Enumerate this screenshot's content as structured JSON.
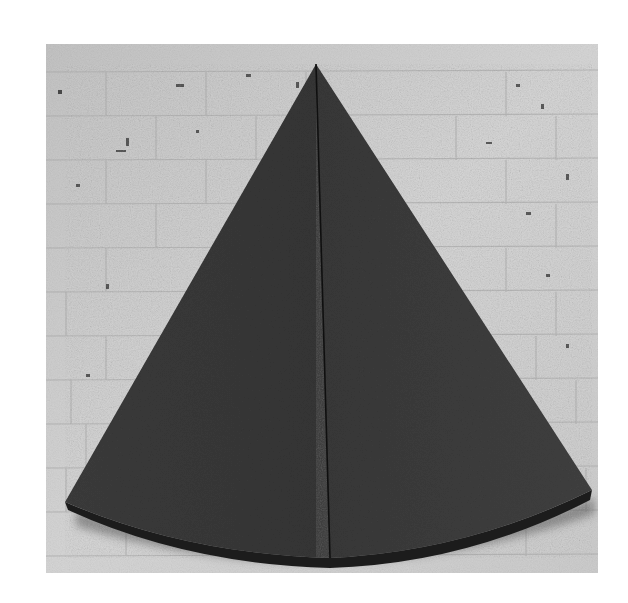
{
  "artwork": {
    "description": "Black-and-white photograph of a dark fan-shaped (circular sector) wall sculpture mounted on a whitewashed brick wall, divided vertically by a thin line into two panels.",
    "subject": "circular sector sculpture",
    "background": "white brick wall",
    "colors": {
      "frame": "#ffffff",
      "wall": "#cfcfcf",
      "mortar": "#9a9a9a",
      "sculpture": "#3a3a3a",
      "sculpture_edge": "#1e1e1e",
      "divider": "#111111",
      "shadow": "#555555"
    }
  }
}
